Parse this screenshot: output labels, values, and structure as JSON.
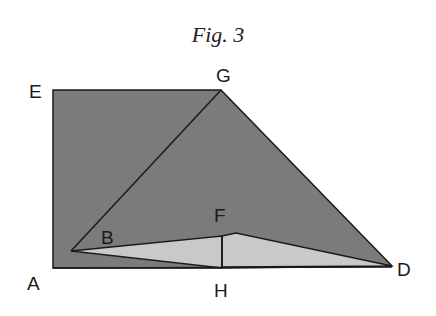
{
  "figure": {
    "caption": "Fig. 3",
    "colors": {
      "dark_fill": "#7b7b7b",
      "light_fill": "#c9c9c9",
      "stroke": "#1a1a1a"
    },
    "points": {
      "A": {
        "label": "A",
        "x": 53,
        "y": 268
      },
      "E": {
        "label": "E",
        "x": 53,
        "y": 90
      },
      "G": {
        "label": "G",
        "x": 221,
        "y": 90
      },
      "D": {
        "label": "D",
        "x": 392,
        "y": 266
      },
      "B": {
        "label": "B",
        "x": 71,
        "y": 251
      },
      "F": {
        "label": "F",
        "x": 222,
        "y": 236
      },
      "H": {
        "label": "H",
        "x": 222,
        "y": 268
      }
    },
    "labels": [
      {
        "id": "E",
        "text": "E",
        "x": 29,
        "y": 98
      },
      {
        "id": "G",
        "text": "G",
        "x": 216,
        "y": 82
      },
      {
        "id": "A",
        "text": "A",
        "x": 27,
        "y": 290
      },
      {
        "id": "B",
        "text": "B",
        "x": 101,
        "y": 244
      },
      {
        "id": "F",
        "text": "F",
        "x": 214,
        "y": 222
      },
      {
        "id": "H",
        "text": "H",
        "x": 214,
        "y": 297
      },
      {
        "id": "D",
        "text": "D",
        "x": 397,
        "y": 276
      }
    ]
  }
}
